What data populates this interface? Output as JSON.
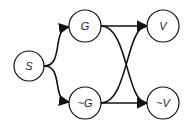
{
  "diagram": {
    "nodes": [
      {
        "id": "S",
        "label": "S",
        "cx": 29,
        "cy": 66
      },
      {
        "id": "G",
        "label": "G",
        "cx": 85,
        "cy": 26
      },
      {
        "id": "notG",
        "label": "~G",
        "cx": 85,
        "cy": 103
      },
      {
        "id": "V",
        "label": "V",
        "cx": 163,
        "cy": 26
      },
      {
        "id": "notV",
        "label": "~V",
        "cx": 163,
        "cy": 103
      }
    ],
    "edges": [
      {
        "from": "S",
        "to": "G"
      },
      {
        "from": "S",
        "to": "~G"
      },
      {
        "from": "G",
        "to": "V"
      },
      {
        "from": "G",
        "to": "~V"
      },
      {
        "from": "~G",
        "to": "V"
      },
      {
        "from": "~G",
        "to": "~V"
      }
    ],
    "colors": {
      "stroke": "#111111",
      "fill": "#ffffff"
    }
  }
}
